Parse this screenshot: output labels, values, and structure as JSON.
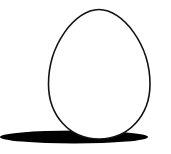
{
  "illustration": {
    "subject": "egg",
    "colors": {
      "background": "#ffffff",
      "egg_fill": "#ffffff",
      "egg_outline": "#111111",
      "shadow": "#000000"
    }
  }
}
